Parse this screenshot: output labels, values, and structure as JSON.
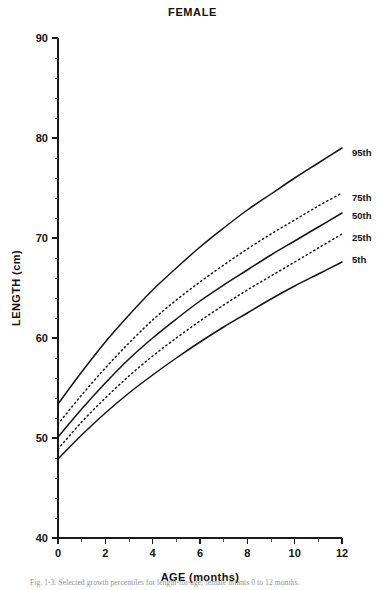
{
  "chart_data": {
    "type": "line",
    "title": "FEMALE",
    "xlabel": "AGE (months)",
    "ylabel": "LENGTH (cm)",
    "xlim": [
      0,
      12
    ],
    "ylim": [
      40,
      90
    ],
    "x_ticks": [
      0,
      2,
      4,
      6,
      8,
      10,
      12
    ],
    "x_tick_labels": [
      "0",
      "2",
      "4",
      "6",
      "8",
      "10",
      "12"
    ],
    "x_minor_step": 1,
    "y_ticks": [
      40,
      50,
      60,
      70,
      80,
      90
    ],
    "y_tick_labels": [
      "40",
      "50",
      "60",
      "70",
      "80",
      "90"
    ],
    "y_minor_step": 2,
    "grid": false,
    "legend_position": "right-inline",
    "x": [
      0,
      1,
      2,
      3,
      4,
      5,
      6,
      7,
      8,
      9,
      10,
      11,
      12
    ],
    "series": [
      {
        "name": "95th",
        "label": "95th",
        "style": "solid",
        "values": [
          53.4,
          56.6,
          59.6,
          62.3,
          64.8,
          67.0,
          69.1,
          71.0,
          72.8,
          74.4,
          76.0,
          77.5,
          79.0
        ]
      },
      {
        "name": "75th",
        "label": "75th",
        "style": "dotted",
        "values": [
          51.4,
          54.3,
          57.0,
          59.5,
          61.8,
          63.8,
          65.6,
          67.3,
          68.9,
          70.4,
          71.8,
          73.2,
          74.5
        ]
      },
      {
        "name": "50th",
        "label": "50th",
        "style": "solid",
        "values": [
          50.1,
          52.9,
          55.5,
          57.9,
          60.0,
          61.9,
          63.7,
          65.3,
          66.8,
          68.3,
          69.7,
          71.1,
          72.5
        ]
      },
      {
        "name": "25th",
        "label": "25th",
        "style": "dotted",
        "values": [
          48.9,
          51.6,
          54.0,
          56.2,
          58.2,
          60.0,
          61.7,
          63.3,
          64.8,
          66.2,
          67.6,
          69.0,
          70.4
        ]
      },
      {
        "name": "5th",
        "label": "5th",
        "style": "solid",
        "values": [
          47.9,
          50.3,
          52.5,
          54.5,
          56.3,
          58.0,
          59.6,
          61.1,
          62.5,
          63.9,
          65.2,
          66.4,
          67.6
        ]
      }
    ],
    "caption": "Fig. 1-3.  Selected growth percentiles for length-for-age, female infants 0 to 12 months."
  }
}
